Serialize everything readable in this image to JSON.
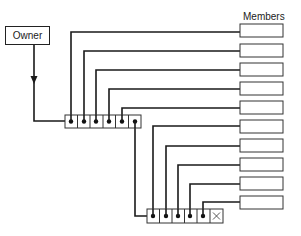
{
  "diagram": {
    "type": "linked-pointer-structure",
    "owner": {
      "label": "Owner"
    },
    "members": {
      "label": "Members",
      "count": 11
    },
    "pointer_blocks": [
      {
        "cells": 6,
        "filled_pointers": 6,
        "terminator": false
      },
      {
        "cells": 6,
        "filled_pointers": 5,
        "terminator": true,
        "terminator_symbol": "X"
      }
    ],
    "colors": {
      "line": "#1a1a1a",
      "box_border": "#333333",
      "background": "#ffffff"
    }
  }
}
